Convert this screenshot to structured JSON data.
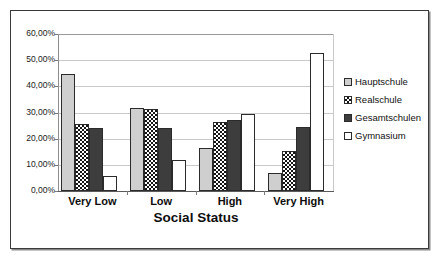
{
  "chart_data": {
    "type": "bar",
    "title": "",
    "xlabel": "Social Status",
    "ylabel": "",
    "categories": [
      "Very Low",
      "Low",
      "High",
      "Very High"
    ],
    "series": [
      {
        "name": "Hauptschule",
        "values": [
          44.7,
          31.8,
          16.5,
          6.7
        ],
        "fill": "solid-light",
        "color": "#CFCFCF"
      },
      {
        "name": "Realschule",
        "values": [
          25.8,
          31.5,
          26.5,
          15.3
        ],
        "fill": "checker",
        "color": "#141414"
      },
      {
        "name": "Gesamtschulen",
        "values": [
          24.1,
          24.0,
          27.0,
          24.5
        ],
        "fill": "solid-dark",
        "color": "#3D3D3D"
      },
      {
        "name": "Gymnasium",
        "values": [
          5.6,
          11.9,
          29.4,
          52.7
        ],
        "fill": "white",
        "color": "#FFFFFF"
      }
    ],
    "ylim": [
      0,
      60
    ],
    "ytick_values": [
      0,
      10,
      20,
      30,
      40,
      50,
      60
    ],
    "ytick_labels": [
      "0,00%",
      "10,00%",
      "20,00%",
      "30,00%",
      "40,00%",
      "50,00%",
      "60,00%"
    ],
    "grid": true,
    "legend_position": "right",
    "value_unit": "%"
  },
  "axes": {
    "y_labels": [
      "60,00%",
      "50,00%",
      "40,00%",
      "30,00%",
      "20,00%",
      "10,00%",
      "0,00%"
    ],
    "x_labels": [
      "Very Low",
      "Low",
      "High",
      "Very High"
    ],
    "x_title": "Social Status"
  },
  "legend": {
    "items": [
      {
        "label": "Hauptschule"
      },
      {
        "label": "Realschule"
      },
      {
        "label": "Gesamtschulen"
      },
      {
        "label": "Gymnasium"
      }
    ]
  }
}
